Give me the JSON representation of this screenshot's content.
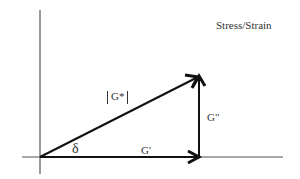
{
  "diagram": {
    "title": "Stress/Strain",
    "labels": {
      "complex_modulus": "G*",
      "storage_modulus": "G'",
      "loss_modulus": "G\"",
      "phase_angle": "δ"
    },
    "colors": {
      "line": "#111111",
      "axis": "#555555",
      "background": "#ffffff"
    }
  }
}
